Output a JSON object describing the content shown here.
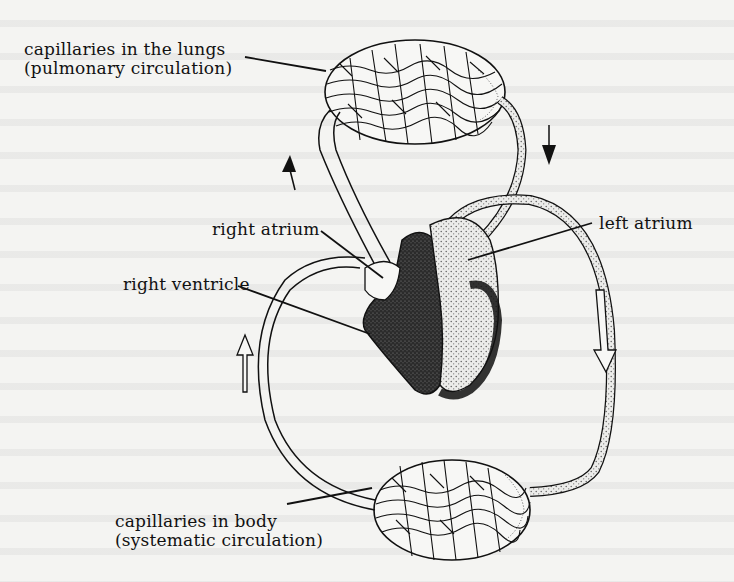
{
  "diagram": {
    "labels": {
      "lung_capillaries": {
        "line1": "capillaries in the lungs",
        "line2": "(pulmonary circulation)"
      },
      "right_atrium": "right atrium",
      "left_atrium": "left atrium",
      "right_ventricle": "right ventricle",
      "body_capillaries": {
        "line1": "capillaries in body",
        "line2": "(systematic circulation)"
      }
    },
    "arrows": [
      {
        "name": "pulmonary-artery-flow",
        "direction": "up"
      },
      {
        "name": "pulmonary-vein-flow",
        "direction": "down"
      },
      {
        "name": "aorta-flow",
        "direction": "down"
      },
      {
        "name": "vena-cava-flow",
        "direction": "up"
      }
    ],
    "colors": {
      "background": "#f4f4f2",
      "ink": "#111111",
      "oxygenated_fill": "#e6e6e6",
      "muscle_fill": "#2a2a2a"
    }
  }
}
